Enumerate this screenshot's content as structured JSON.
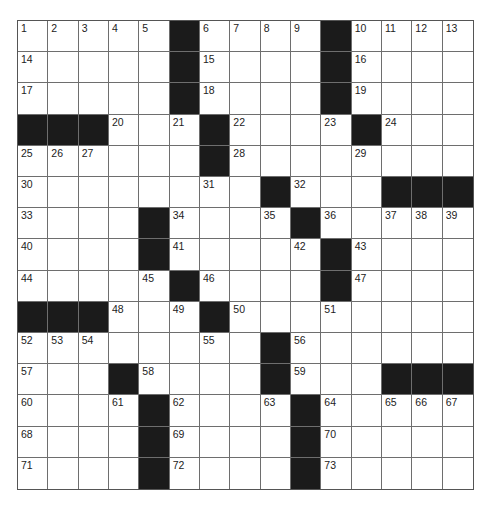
{
  "puzzle": {
    "rows": 15,
    "cols": 15,
    "block_color": "#1b1b1b",
    "line_color": "#6e6e6e",
    "grid": [
      [
        "1",
        "2",
        "3",
        "4",
        "5",
        "#",
        "6",
        "7",
        "8",
        "9",
        "#",
        "10",
        "11",
        "12",
        "13"
      ],
      [
        "14",
        ".",
        ".",
        ".",
        ".",
        "#",
        "15",
        ".",
        ".",
        ".",
        "#",
        "16",
        ".",
        ".",
        "."
      ],
      [
        "17",
        ".",
        ".",
        ".",
        ".",
        "#",
        "18",
        ".",
        ".",
        ".",
        "#",
        "19",
        ".",
        ".",
        "."
      ],
      [
        "#",
        "#",
        "#",
        "20",
        ".",
        "21",
        "#",
        "22",
        ".",
        ".",
        "23",
        "#",
        "24",
        ".",
        "."
      ],
      [
        "25",
        "26",
        "27",
        ".",
        ".",
        ".",
        "#",
        "28",
        ".",
        ".",
        ".",
        "29",
        ".",
        ".",
        "."
      ],
      [
        "30",
        ".",
        ".",
        ".",
        ".",
        ".",
        "31",
        ".",
        "#",
        "32",
        ".",
        ".",
        "#",
        "#",
        "#"
      ],
      [
        "33",
        ".",
        ".",
        ".",
        "#",
        "34",
        ".",
        ".",
        "35",
        "#",
        "36",
        ".",
        "37",
        "38",
        "39"
      ],
      [
        "40",
        ".",
        ".",
        ".",
        "#",
        "41",
        ".",
        ".",
        ".",
        "42",
        "#",
        "43",
        ".",
        ".",
        "."
      ],
      [
        "44",
        ".",
        ".",
        ".",
        "45",
        "#",
        "46",
        ".",
        ".",
        ".",
        "#",
        "47",
        ".",
        ".",
        "."
      ],
      [
        "#",
        "#",
        "#",
        "48",
        ".",
        "49",
        "#",
        "50",
        ".",
        ".",
        "51",
        ".",
        ".",
        ".",
        "."
      ],
      [
        "52",
        "53",
        "54",
        ".",
        ".",
        ".",
        "55",
        ".",
        "#",
        "56",
        ".",
        ".",
        ".",
        ".",
        "."
      ],
      [
        "57",
        ".",
        ".",
        "#",
        "58",
        ".",
        ".",
        ".",
        "#",
        "59",
        ".",
        ".",
        "#",
        "#",
        "#"
      ],
      [
        "60",
        ".",
        ".",
        "61",
        "#",
        "62",
        ".",
        ".",
        "63",
        "#",
        "64",
        ".",
        "65",
        "66",
        "67"
      ],
      [
        "68",
        ".",
        ".",
        ".",
        "#",
        "69",
        ".",
        ".",
        ".",
        "#",
        "70",
        ".",
        ".",
        ".",
        "."
      ],
      [
        "71",
        ".",
        ".",
        ".",
        "#",
        "72",
        ".",
        ".",
        ".",
        "#",
        "73",
        ".",
        ".",
        ".",
        "."
      ]
    ]
  }
}
